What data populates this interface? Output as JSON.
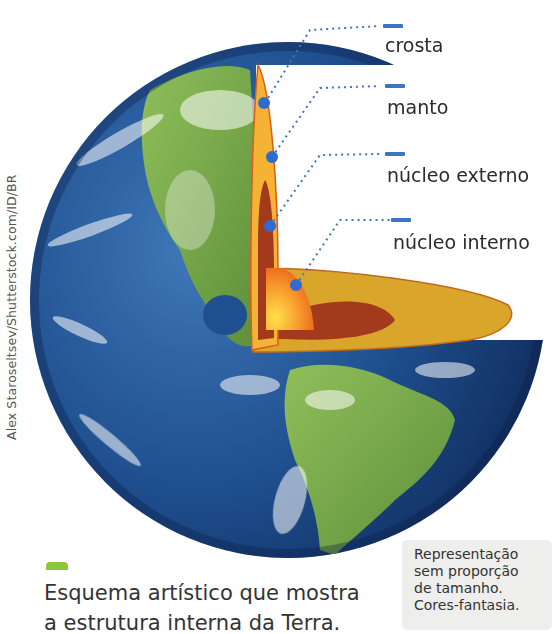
{
  "diagram": {
    "type": "earth-internal-structure-cutaway",
    "layers": [
      {
        "key": "crosta",
        "label": "crosta",
        "color": "#f5b335"
      },
      {
        "key": "manto",
        "label": "manto",
        "color": "#f5a623"
      },
      {
        "key": "nucleo_externo",
        "label": "núcleo externo",
        "color": "#a43a1c"
      },
      {
        "key": "nucleo_interno",
        "label": "núcleo interno",
        "color": "#f08a24"
      }
    ],
    "leader_color": "#3d74c6",
    "marker_color": "#2f6bd0"
  },
  "labels": {
    "crust": "crosta",
    "mantle": "manto",
    "outer_core": "núcleo externo",
    "inner_core": "núcleo interno"
  },
  "credit": "Alex Staroseltsev/Shutterstock.com/ID/BR",
  "caption": {
    "line1": "Esquema artístico que mostra",
    "line2": "a estrutura interna da Terra."
  },
  "note": {
    "line1": "Representação",
    "line2": "sem proporção",
    "line3": "de tamanho.",
    "line4": "Cores-fantasia."
  },
  "colors": {
    "accent_green": "#8cc63f",
    "label_blue": "#3d74c6",
    "note_bg": "#eeeeec"
  }
}
